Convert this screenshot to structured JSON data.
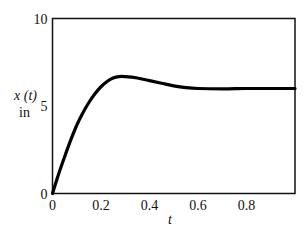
{
  "chart_data": {
    "type": "line",
    "title": "",
    "xlabel": "t",
    "ylabel": "x (t)",
    "ylabel_unit": "in",
    "xlim": [
      0,
      1.0
    ],
    "ylim": [
      0,
      10
    ],
    "grid": false,
    "legend": null,
    "x_ticks": [
      "0",
      "0.2",
      "0.4",
      "0.6",
      "0.8"
    ],
    "y_ticks": [
      "0",
      "5",
      "10"
    ],
    "series": [
      {
        "name": "x(t)",
        "x": [
          0,
          0.025,
          0.05,
          0.075,
          0.1,
          0.125,
          0.15,
          0.175,
          0.2,
          0.225,
          0.25,
          0.275,
          0.3,
          0.35,
          0.4,
          0.45,
          0.5,
          0.55,
          0.6,
          0.7,
          0.8,
          0.9,
          1.0
        ],
        "values": [
          0,
          1.1,
          2.1,
          3.05,
          3.9,
          4.6,
          5.2,
          5.7,
          6.1,
          6.4,
          6.6,
          6.68,
          6.68,
          6.6,
          6.45,
          6.3,
          6.15,
          6.05,
          6.0,
          5.98,
          6.0,
          6.0,
          6.0
        ]
      }
    ]
  }
}
